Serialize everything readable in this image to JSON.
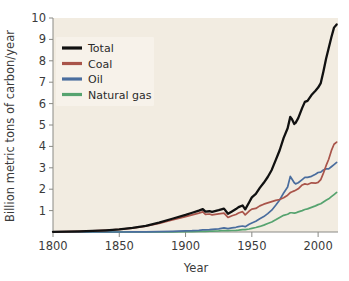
{
  "chart_data": {
    "type": "line",
    "title": "",
    "xlabel": "Year",
    "ylabel": "Billion metric tons of carbon/year",
    "xlim": [
      1800,
      2015
    ],
    "ylim": [
      0,
      10
    ],
    "grid": false,
    "legend_position": "upper-left",
    "xticks": [
      1800,
      1850,
      1900,
      1950,
      2000
    ],
    "xtick_labels": [
      "1800",
      "1850",
      "1900",
      "1950",
      "2000"
    ],
    "yticks": [
      1,
      2,
      3,
      4,
      5,
      6,
      7,
      8,
      9,
      10
    ],
    "ytick_labels": [
      "1",
      "2",
      "3",
      "4",
      "5",
      "6",
      "7",
      "8",
      "9",
      "10"
    ],
    "colors": {
      "total": "#111111",
      "coal": "#a9544a",
      "oil": "#4a6d9e",
      "natural_gas": "#56a36f",
      "plot_background": "#f2ece1",
      "figure_background": "#ffffff",
      "axis": "#8a8a85",
      "text": "#3b3b3b"
    },
    "x": [
      1800,
      1810,
      1820,
      1830,
      1840,
      1850,
      1860,
      1870,
      1880,
      1890,
      1900,
      1905,
      1910,
      1913,
      1915,
      1918,
      1920,
      1925,
      1929,
      1932,
      1935,
      1938,
      1940,
      1943,
      1945,
      1948,
      1950,
      1953,
      1956,
      1959,
      1962,
      1965,
      1968,
      1971,
      1974,
      1977,
      1979,
      1980,
      1982,
      1983,
      1985,
      1988,
      1990,
      1992,
      1995,
      1998,
      2000,
      2002,
      2004,
      2006,
      2008,
      2010,
      2012,
      2014
    ],
    "series": [
      {
        "name": "Total",
        "color": "#111111",
        "values": [
          0.01,
          0.02,
          0.03,
          0.05,
          0.08,
          0.12,
          0.19,
          0.29,
          0.44,
          0.62,
          0.8,
          0.9,
          1.0,
          1.07,
          0.95,
          0.97,
          0.94,
          1.02,
          1.09,
          0.85,
          0.96,
          1.07,
          1.16,
          1.24,
          1.06,
          1.39,
          1.62,
          1.78,
          2.06,
          2.3,
          2.57,
          2.9,
          3.36,
          3.82,
          4.4,
          4.85,
          5.38,
          5.3,
          5.05,
          5.1,
          5.32,
          5.8,
          6.08,
          6.13,
          6.4,
          6.6,
          6.75,
          6.96,
          7.5,
          8.1,
          8.6,
          9.1,
          9.55,
          9.7
        ]
      },
      {
        "name": "Coal",
        "color": "#a9544a",
        "values": [
          0.01,
          0.02,
          0.03,
          0.05,
          0.08,
          0.12,
          0.18,
          0.27,
          0.4,
          0.56,
          0.72,
          0.8,
          0.88,
          0.94,
          0.82,
          0.84,
          0.8,
          0.85,
          0.88,
          0.68,
          0.76,
          0.82,
          0.89,
          0.95,
          0.8,
          0.98,
          1.07,
          1.1,
          1.22,
          1.3,
          1.36,
          1.42,
          1.48,
          1.52,
          1.6,
          1.72,
          1.84,
          1.87,
          1.92,
          1.95,
          2.02,
          2.2,
          2.25,
          2.22,
          2.3,
          2.28,
          2.32,
          2.45,
          2.75,
          3.1,
          3.4,
          3.8,
          4.1,
          4.2
        ]
      },
      {
        "name": "Oil",
        "color": "#4a6d9e",
        "values": [
          0.0,
          0.0,
          0.0,
          0.0,
          0.0,
          0.0,
          0.005,
          0.01,
          0.02,
          0.03,
          0.05,
          0.06,
          0.08,
          0.1,
          0.1,
          0.11,
          0.12,
          0.15,
          0.19,
          0.16,
          0.19,
          0.22,
          0.25,
          0.28,
          0.25,
          0.36,
          0.42,
          0.5,
          0.62,
          0.72,
          0.86,
          1.02,
          1.25,
          1.5,
          1.82,
          2.1,
          2.6,
          2.5,
          2.3,
          2.25,
          2.3,
          2.45,
          2.55,
          2.55,
          2.6,
          2.7,
          2.78,
          2.8,
          2.9,
          2.95,
          2.95,
          3.05,
          3.15,
          3.25
        ]
      },
      {
        "name": "Natural gas",
        "color": "#56a36f",
        "values": [
          0.0,
          0.0,
          0.0,
          0.0,
          0.0,
          0.0,
          0.0,
          0.0,
          0.005,
          0.01,
          0.02,
          0.02,
          0.03,
          0.03,
          0.03,
          0.04,
          0.04,
          0.05,
          0.07,
          0.06,
          0.07,
          0.08,
          0.09,
          0.11,
          0.11,
          0.14,
          0.17,
          0.21,
          0.26,
          0.32,
          0.4,
          0.47,
          0.57,
          0.68,
          0.78,
          0.83,
          0.9,
          0.9,
          0.88,
          0.89,
          0.94,
          1.0,
          1.05,
          1.08,
          1.15,
          1.22,
          1.28,
          1.32,
          1.4,
          1.48,
          1.55,
          1.65,
          1.75,
          1.85
        ]
      }
    ]
  },
  "legend": {
    "items": [
      {
        "label": "Total",
        "color": "#111111"
      },
      {
        "label": "Coal",
        "color": "#a9544a"
      },
      {
        "label": "Oil",
        "color": "#4a6d9e"
      },
      {
        "label": "Natural gas",
        "color": "#56a36f"
      }
    ]
  },
  "axes": {
    "x_title": "Year",
    "y_title": "Billion metric tons of carbon/year"
  }
}
